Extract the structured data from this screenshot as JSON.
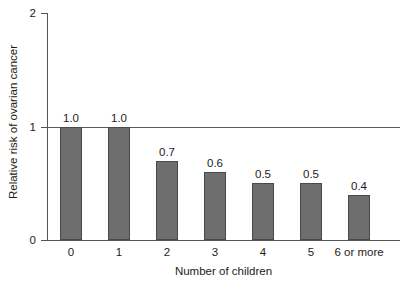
{
  "chart_data": {
    "type": "bar",
    "title": "",
    "xlabel": "Number of children",
    "ylabel": "Relative risk of ovarian cancer",
    "categories": [
      "0",
      "1",
      "2",
      "3",
      "4",
      "5",
      "6 or more"
    ],
    "values": [
      1.0,
      1.0,
      0.7,
      0.6,
      0.5,
      0.5,
      0.4
    ],
    "value_labels": [
      "1.0",
      "1.0",
      "0.7",
      "0.6",
      "0.5",
      "0.5",
      "0.4"
    ],
    "ylim": [
      0,
      2
    ],
    "ytick_labels": [
      "0",
      "1",
      "2"
    ],
    "ytick_values": [
      0,
      1,
      2
    ],
    "grid": false,
    "legend": null,
    "reference_line": {
      "value": 1,
      "label": ""
    },
    "colors": {
      "bar_fill": "#6e6e6e",
      "bar_border": "#4a4a4a",
      "axis": "#555555",
      "text": "#1c1c1c",
      "background": "#ffffff"
    }
  }
}
